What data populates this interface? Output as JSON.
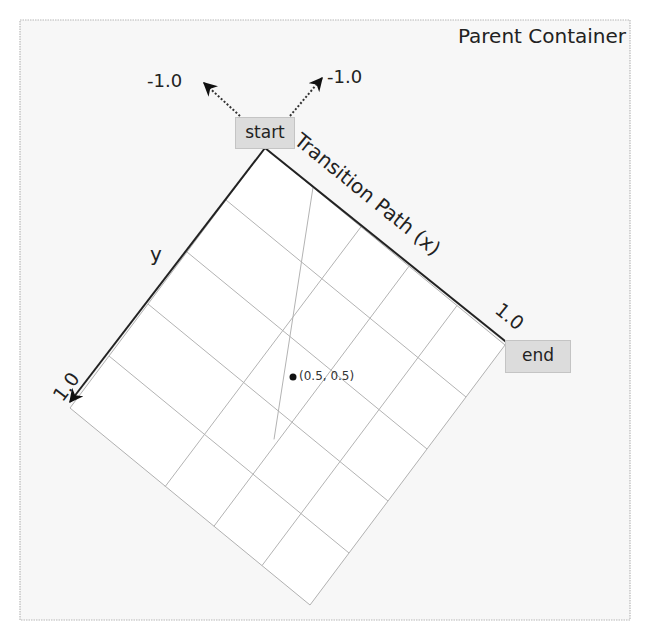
{
  "container": {
    "title": "Parent Container"
  },
  "nodes": {
    "start": {
      "label": "start"
    },
    "end": {
      "label": "end"
    }
  },
  "axes": {
    "x": {
      "label": "Transition Path (x)",
      "end_value": "1.0"
    },
    "y": {
      "label": "y",
      "end_value": "1.0"
    },
    "neg_left": {
      "value": "-1.0"
    },
    "neg_right": {
      "value": "-1.0"
    }
  },
  "point": {
    "label": "(0.5, 0.5)",
    "x": 0.5,
    "y": 0.5
  },
  "grid": {
    "divisions": 5
  },
  "colors": {
    "frame_bg": "#f7f7f7",
    "frame_border": "#b8b8b8",
    "grid_fill": "#ffffff",
    "grid_line": "#b0b0b0",
    "axis": "#222222",
    "node_fill": "#dcdcdc"
  }
}
